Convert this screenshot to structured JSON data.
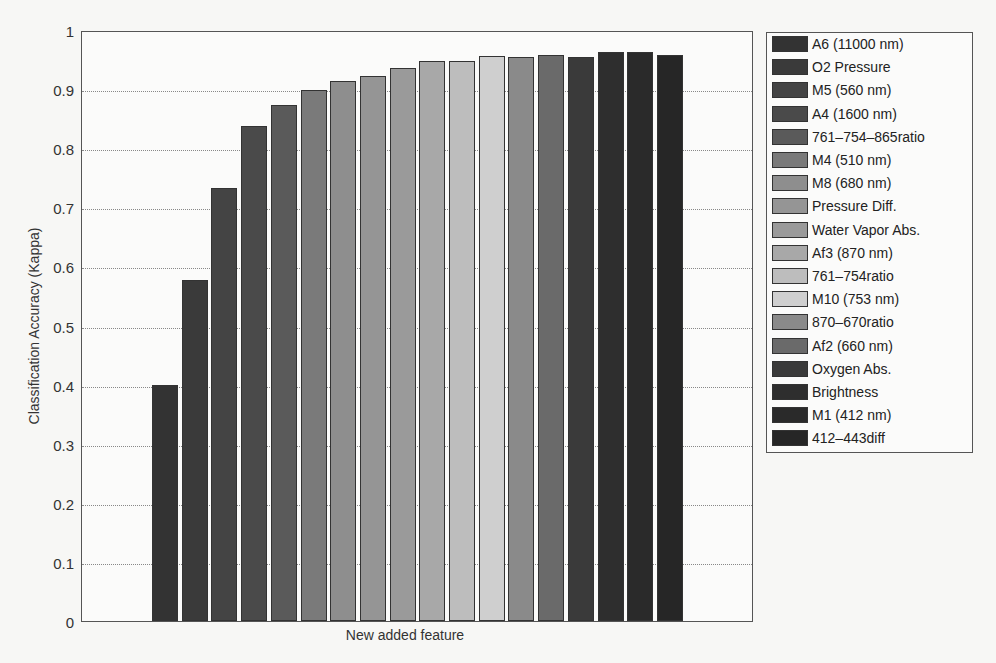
{
  "chart_data": {
    "type": "bar",
    "title": "",
    "xlabel": "New added feature",
    "ylabel": "Classification Accuracy (Kappa)",
    "ylim": [
      0,
      1
    ],
    "yticks": [
      "0",
      "0.1",
      "0.2",
      "0.3",
      "0.4",
      "0.5",
      "0.6",
      "0.7",
      "0.8",
      "0.9",
      "1"
    ],
    "grid": true,
    "legend_position": "right-outside",
    "categories": [
      "A6 (11000 nm)",
      "O2 Pressure",
      "M5 (560 nm)",
      "A4 (1600 nm)",
      "761–754–865ratio",
      "M4 (510 nm)",
      "M8 (680 nm)",
      "Pressure Diff.",
      "Water Vapor Abs.",
      "Af3 (870 nm)",
      "761–754ratio",
      "M10 (753 nm)",
      "870–670ratio",
      "Af2 (660 nm)",
      "Oxygen Abs.",
      "Brightness",
      "M1 (412 nm)",
      "412–443diff"
    ],
    "values": [
      0.4,
      0.577,
      0.733,
      0.837,
      0.873,
      0.898,
      0.913,
      0.922,
      0.936,
      0.947,
      0.947,
      0.956,
      0.954,
      0.958,
      0.954,
      0.963,
      0.963,
      0.957
    ],
    "colors": [
      "#333333",
      "#3a3a3a",
      "#444444",
      "#4a4a4a",
      "#5a5a5a",
      "#7a7a7a",
      "#8e8e8e",
      "#959595",
      "#9a9a9a",
      "#a8a8a8",
      "#bdbdbd",
      "#cfcfcf",
      "#8a8a8a",
      "#6a6a6a",
      "#3a3a3a",
      "#2e2e2e",
      "#2a2a2a",
      "#262626"
    ]
  }
}
